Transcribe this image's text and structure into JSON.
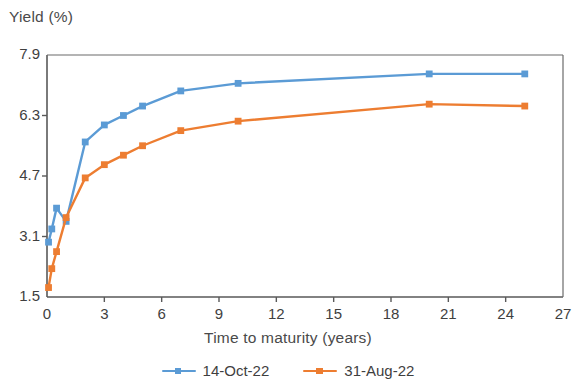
{
  "chart_data": {
    "type": "line",
    "title": "",
    "xlabel": "Time to maturity (years)",
    "ylabel": "Yield (%)",
    "xlim": [
      0,
      27
    ],
    "ylim": [
      1.5,
      7.9
    ],
    "xticks": [
      "0",
      "3",
      "6",
      "9",
      "12",
      "15",
      "18",
      "21",
      "24",
      "27"
    ],
    "yticks": [
      "1.5",
      "3.1",
      "4.7",
      "6.3",
      "7.9"
    ],
    "grid": false,
    "legend_position": "bottom",
    "series": [
      {
        "name": "14-Oct-22",
        "color": "#5B9BD5",
        "x": [
          0.08,
          0.25,
          0.5,
          1.0,
          2.0,
          3.0,
          4.0,
          5.0,
          7.0,
          10.0,
          20.0,
          25.0
        ],
        "values": [
          2.95,
          3.3,
          3.85,
          3.5,
          5.6,
          6.05,
          6.3,
          6.55,
          6.95,
          7.15,
          7.4,
          7.4
        ]
      },
      {
        "name": "31-Aug-22",
        "color": "#ED7D31",
        "x": [
          0.08,
          0.25,
          0.5,
          1.0,
          2.0,
          3.0,
          4.0,
          5.0,
          7.0,
          10.0,
          20.0,
          25.0
        ],
        "values": [
          1.75,
          2.25,
          2.7,
          3.6,
          4.65,
          5.0,
          5.25,
          5.5,
          5.9,
          6.15,
          6.6,
          6.55
        ]
      }
    ]
  },
  "legend": {
    "entries": [
      {
        "label": "14-Oct-22"
      },
      {
        "label": "31-Aug-22"
      }
    ]
  },
  "axes": {
    "y_title": "Yield (%)",
    "x_title": "Time to maturity (years)"
  },
  "colors": {
    "series_1": "#5B9BD5",
    "series_2": "#ED7D31",
    "axis": "#595959",
    "text": "#3f3f3f"
  }
}
